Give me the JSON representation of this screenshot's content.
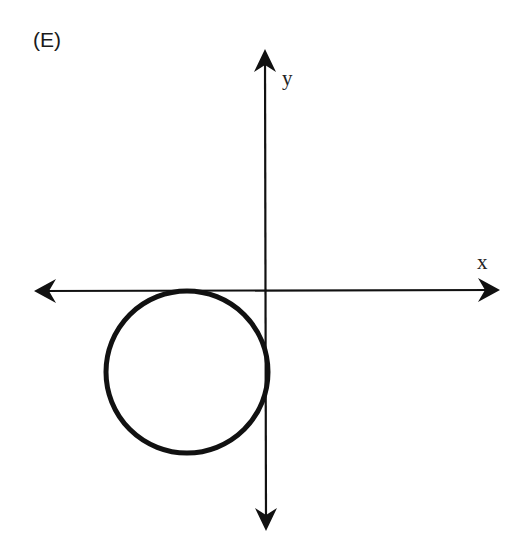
{
  "figure": {
    "option_label": "(E)",
    "x_axis_label": "x",
    "y_axis_label": "y",
    "colors": {
      "stroke": "#111111",
      "background": "#ffffff"
    },
    "circle": {
      "cx": 187,
      "cy": 372,
      "r": 82
    }
  }
}
